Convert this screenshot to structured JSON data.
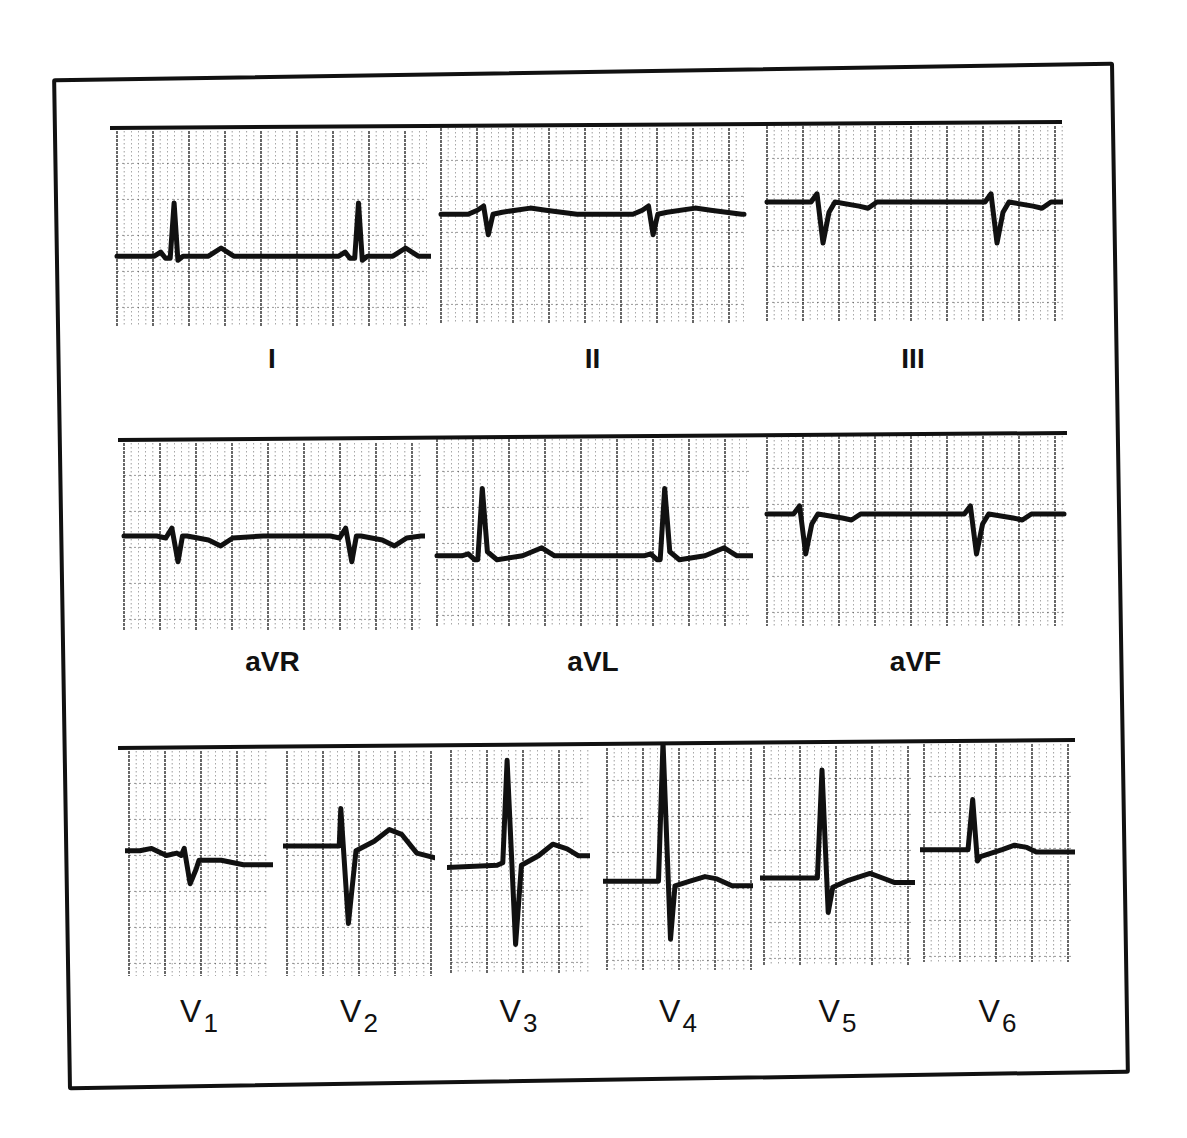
{
  "figure": {
    "grid_color": "#222222",
    "trace_color": "#111111",
    "rows": [
      {
        "id": "limb",
        "leads": [
          {
            "label": "I",
            "x": 113,
            "y": 125,
            "w": 318,
            "h": 205,
            "baseline": 0.64,
            "beats": [
              0.18,
              0.76
            ],
            "morph": "upright_r"
          },
          {
            "label": "II",
            "x": 437,
            "y": 122,
            "w": 311,
            "h": 205,
            "baseline": 0.45,
            "beats": [
              0.15,
              0.68
            ],
            "morph": "small_q_deep"
          },
          {
            "label": "III",
            "x": 763,
            "y": 120,
            "w": 300,
            "h": 205,
            "baseline": 0.4,
            "beats": [
              0.18,
              0.76
            ],
            "morph": "deep_q"
          }
        ],
        "label_y": 345
      },
      {
        "id": "augmented",
        "leads": [
          {
            "label": "aVR",
            "x": 120,
            "y": 437,
            "w": 305,
            "h": 198,
            "baseline": 0.5,
            "beats": [
              0.17,
              0.74
            ],
            "morph": "rsr_neg"
          },
          {
            "label": "aVL",
            "x": 433,
            "y": 433,
            "w": 320,
            "h": 198,
            "baseline": 0.62,
            "beats": [
              0.14,
              0.71
            ],
            "morph": "upright_r_tall"
          },
          {
            "label": "aVF",
            "x": 763,
            "y": 430,
            "w": 305,
            "h": 200,
            "baseline": 0.42,
            "beats": [
              0.12,
              0.68
            ],
            "morph": "deep_q"
          }
        ],
        "label_y": 648
      },
      {
        "id": "precordial",
        "leads": [
          {
            "label": "V",
            "sub": "1",
            "x": 125,
            "y": 745,
            "w": 148,
            "h": 235,
            "baseline": 0.45,
            "beats": [
              0.4
            ],
            "morph": "v1"
          },
          {
            "label": "V",
            "sub": "2",
            "x": 283,
            "y": 745,
            "w": 152,
            "h": 235,
            "baseline": 0.43,
            "beats": [
              0.38
            ],
            "morph": "v2"
          },
          {
            "label": "V",
            "sub": "3",
            "x": 447,
            "y": 744,
            "w": 143,
            "h": 233,
            "baseline": 0.53,
            "beats": [
              0.4
            ],
            "morph": "v3"
          },
          {
            "label": "V",
            "sub": "4",
            "x": 603,
            "y": 742,
            "w": 150,
            "h": 232,
            "baseline": 0.6,
            "beats": [
              0.38
            ],
            "morph": "v4"
          },
          {
            "label": "V",
            "sub": "5",
            "x": 760,
            "y": 740,
            "w": 155,
            "h": 230,
            "baseline": 0.6,
            "beats": [
              0.37
            ],
            "morph": "v5"
          },
          {
            "label": "V",
            "sub": "6",
            "x": 920,
            "y": 738,
            "w": 155,
            "h": 228,
            "baseline": 0.49,
            "beats": [
              0.33
            ],
            "morph": "v6"
          }
        ],
        "label_y": 995
      }
    ],
    "row_bars": [
      {
        "x1": 110,
        "y1": 126,
        "x2": 1062,
        "y2": 120
      },
      {
        "x1": 118,
        "y1": 438,
        "x2": 1067,
        "y2": 431
      },
      {
        "x1": 118,
        "y1": 746,
        "x2": 1075,
        "y2": 738
      }
    ],
    "labels_text": [
      "I",
      "II",
      "III",
      "aVR",
      "aVL",
      "aVF",
      "V1",
      "V2",
      "V3",
      "V4",
      "V5",
      "V6"
    ]
  }
}
